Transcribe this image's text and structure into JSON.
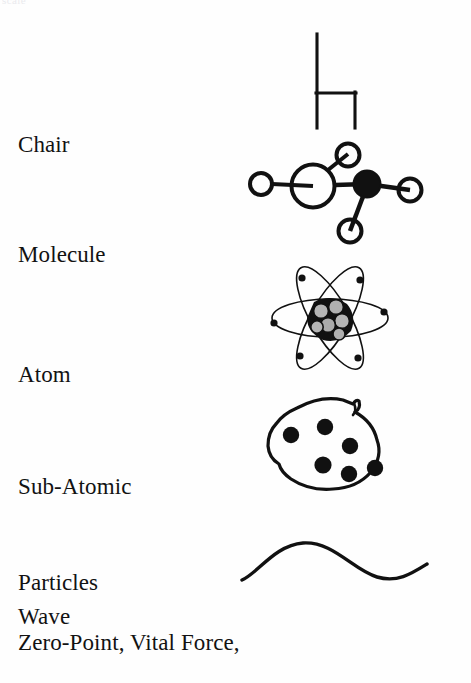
{
  "page": {
    "background_color": "#ffffff",
    "ink_color": "#111111",
    "clipped_top_text": "scale"
  },
  "rows": [
    {
      "id": "chair",
      "label": "Chair",
      "label_lines": [
        "Chair"
      ],
      "illustration": "chair-line-drawing"
    },
    {
      "id": "molecule",
      "label": "Molecule",
      "label_lines": [
        "Molecule"
      ],
      "illustration": "molecule-ball-and-stick"
    },
    {
      "id": "atom",
      "label": "Atom",
      "label_lines": [
        "Atom"
      ],
      "illustration": "atom-orbits-nucleus"
    },
    {
      "id": "particles",
      "label": "Sub-Atomic Particles",
      "label_lines": [
        "Sub-Atomic",
        "Particles"
      ],
      "illustration": "subatomic-particle-cloud"
    },
    {
      "id": "wave",
      "label": "Wave",
      "label_lines": [
        "Wave"
      ],
      "illustration": "sine-wave-curve"
    }
  ],
  "caption": "Zero-Point, Vital Force,",
  "icons": {
    "chair": "chair-icon",
    "molecule": "molecule-icon",
    "atom": "atom-icon",
    "particles": "particle-cloud-icon",
    "wave": "wave-icon"
  }
}
